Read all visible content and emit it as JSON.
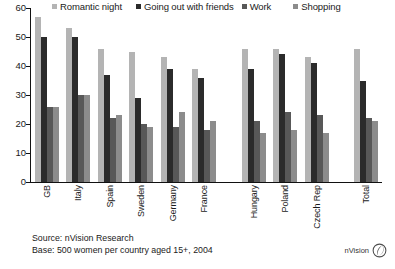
{
  "chart_data": {
    "type": "bar",
    "title": "",
    "xlabel": "",
    "ylabel": "",
    "ylim": [
      0,
      60
    ],
    "yticks": [
      0,
      10,
      20,
      30,
      40,
      50,
      60
    ],
    "grid": false,
    "legend_position": "top",
    "categories": [
      "GB",
      "Italy",
      "Spain",
      "Sweden",
      "Germany",
      "France",
      "Hungary",
      "Poland",
      "Czech Rep",
      "Total"
    ],
    "series": [
      {
        "name": "Romantic night",
        "color": "#b4b4b4",
        "values": [
          57,
          53,
          46,
          45,
          43,
          39,
          46,
          46,
          43,
          46
        ]
      },
      {
        "name": "Going out with friends",
        "color": "#2b2b2b",
        "values": [
          50,
          50,
          37,
          29,
          39,
          36,
          39,
          44,
          41,
          35
        ]
      },
      {
        "name": "Work",
        "color": "#585858",
        "values": [
          26,
          30,
          22,
          20,
          19,
          18,
          21,
          24,
          23,
          22
        ]
      },
      {
        "name": "Shopping",
        "color": "#8c8c8c",
        "values": [
          26,
          30,
          23,
          19,
          24,
          21,
          17,
          18,
          17,
          21
        ]
      }
    ],
    "group_gaps_before": [
      "Hungary",
      "Total"
    ]
  },
  "footer": {
    "source": "Source: nVision Research",
    "base": "Base: 500 women per country aged 15+, 2004"
  },
  "brand": {
    "name": "nVision",
    "mark": "nvision-leaf-icon"
  }
}
